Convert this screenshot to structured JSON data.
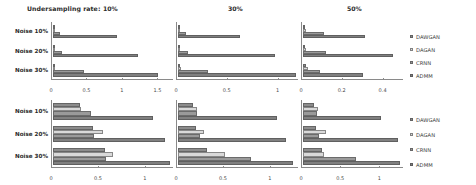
{
  "header": {
    "title": "Undersampling rate:",
    "rates": [
      "10%",
      "30%",
      "50%"
    ]
  },
  "legend": {
    "top_entries": [
      {
        "label": "DAWGAN",
        "color": "#8c8c8c"
      },
      {
        "label": "DAGAN",
        "color": "#d9d9d9"
      },
      {
        "label": "CRNN",
        "color": "#9a9a9a"
      },
      {
        "label": "ADMM",
        "color": "#808080"
      }
    ],
    "bottom_entries": [
      {
        "label": "DAWGAN",
        "color": "#8c8c8c"
      },
      {
        "label": "DAGAN",
        "color": "#d9d9d9"
      },
      {
        "label": "CRNN",
        "color": "#9a9a9a"
      },
      {
        "label": "ADMM",
        "color": "#808080"
      }
    ]
  },
  "row_labels": [
    "Noise 10%",
    "Noise 20%",
    "Noise 30%"
  ],
  "chart_data": {
    "type": "bar",
    "orientation": "horizontal",
    "title": "Undersampling rate:",
    "xlabel": "",
    "ylabel": "",
    "grid": false,
    "legend_position": "right",
    "series_names": [
      "DAWGAN",
      "DAGAN",
      "CRNN",
      "ADMM"
    ],
    "series_colors": [
      "#8c8c8c",
      "#d9d9d9",
      "#9a9a9a",
      "#808080"
    ],
    "categories": [
      "Noise 10%",
      "Noise 20%",
      "Noise 30%"
    ],
    "panels": [
      {
        "row": 0,
        "col": 0,
        "undersampling_rate": "10%",
        "xlim": [
          0,
          1.72
        ],
        "xticks": [
          0,
          0.5,
          1,
          1.5
        ],
        "xticklabels": [
          "0",
          "0.5",
          "1",
          "1.5"
        ],
        "groups": [
          {
            "category": "Noise 10%",
            "values": [
              0.02,
              0.03,
              0.12,
              0.93
            ]
          },
          {
            "category": "Noise 20%",
            "values": [
              0.02,
              0.03,
              0.14,
              1.22
            ]
          },
          {
            "category": "Noise 30%",
            "values": [
              0.03,
              0.04,
              0.46,
              1.51
            ]
          }
        ]
      },
      {
        "row": 0,
        "col": 1,
        "undersampling_rate": "30%",
        "xlim": [
          0,
          1.2
        ],
        "xticks": [
          0,
          0.5,
          1
        ],
        "xticklabels": [
          "0",
          "0.5",
          "1"
        ],
        "groups": [
          {
            "category": "Noise 10%",
            "values": [
              0.02,
              0.03,
              0.09,
              0.62
            ]
          },
          {
            "category": "Noise 20%",
            "values": [
              0.02,
              0.03,
              0.11,
              0.97
            ]
          },
          {
            "category": "Noise 30%",
            "values": [
              0.03,
              0.04,
              0.31,
              1.18
            ]
          }
        ]
      },
      {
        "row": 0,
        "col": 2,
        "undersampling_rate": "50%",
        "xlim": [
          0,
          0.5
        ],
        "xticks": [
          0,
          0.2,
          0.4
        ],
        "xticklabels": [
          "0",
          "0.2",
          "0.4"
        ],
        "groups": [
          {
            "category": "Noise 10%",
            "values": [
              0.01,
              0.02,
              0.11,
              0.31
            ]
          },
          {
            "category": "Noise 20%",
            "values": [
              0.01,
              0.02,
              0.12,
              0.45
            ]
          },
          {
            "category": "Noise 30%",
            "values": [
              0.02,
              0.03,
              0.09,
              0.3
            ]
          }
        ]
      },
      {
        "row": 1,
        "col": 0,
        "undersampling_rate": "10%",
        "xlim": [
          0,
          1.3
        ],
        "xticks": [
          0,
          0.5,
          1
        ],
        "xticklabels": [
          "0",
          "0.5",
          "1"
        ],
        "groups": [
          {
            "category": "Noise 10%",
            "values": [
              0.3,
              0.31,
              0.42,
              1.08
            ]
          },
          {
            "category": "Noise 20%",
            "values": [
              0.44,
              0.55,
              0.45,
              1.21
            ]
          },
          {
            "category": "Noise 30%",
            "values": [
              0.57,
              0.65,
              0.58,
              1.27
            ]
          }
        ]
      },
      {
        "row": 1,
        "col": 1,
        "undersampling_rate": "30%",
        "xlim": [
          0,
          1.3
        ],
        "xticks": [
          0,
          0.5,
          1
        ],
        "xticklabels": [
          "0",
          "0.5",
          "1"
        ],
        "groups": [
          {
            "category": "Noise 10%",
            "values": [
              0.17,
              0.21,
              0.22,
              1.07
            ]
          },
          {
            "category": "Noise 20%",
            "values": [
              0.2,
              0.29,
              0.25,
              1.17
            ]
          },
          {
            "category": "Noise 30%",
            "values": [
              0.32,
              0.52,
              0.8,
              1.25
            ]
          }
        ]
      },
      {
        "row": 1,
        "col": 2,
        "undersampling_rate": "50%",
        "xlim": [
          0,
          1.3
        ],
        "xticks": [
          0,
          0.5,
          1
        ],
        "xticklabels": [
          "0",
          "0.5",
          "1"
        ],
        "groups": [
          {
            "category": "Noise 10%",
            "values": [
              0.16,
              0.21,
              0.19,
              1.02
            ]
          },
          {
            "category": "Noise 20%",
            "values": [
              0.18,
              0.31,
              0.22,
              1.24
            ]
          },
          {
            "category": "Noise 30%",
            "values": [
              0.26,
              0.28,
              0.69,
              1.26
            ]
          }
        ]
      }
    ]
  }
}
